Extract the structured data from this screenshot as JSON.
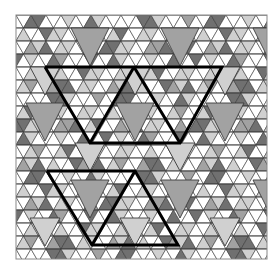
{
  "figure": {
    "type": "geometric-tiling",
    "frame": {
      "x": 16,
      "y": 15,
      "width": 251,
      "height": 244
    },
    "colors": {
      "background": "#ffffff",
      "white": "#ffffff",
      "light": "#d0d0d0",
      "mid": "#a2a2a2",
      "dark": "#707070",
      "stroke": "#3a3a3a",
      "bold": "#000000"
    },
    "lattice": {
      "side": 15,
      "row_height": 13
    },
    "large_triangles": [
      {
        "cx": 90,
        "top": 28,
        "w": 38,
        "h": 38,
        "fill": "mid"
      },
      {
        "cx": 180,
        "top": 28,
        "w": 38,
        "h": 38,
        "fill": "mid"
      },
      {
        "cx": 272,
        "top": 28,
        "w": 38,
        "h": 38,
        "fill": "mid"
      },
      {
        "cx": 45,
        "top": 103,
        "w": 38,
        "h": 38,
        "fill": "mid"
      },
      {
        "cx": 135,
        "top": 103,
        "w": 38,
        "h": 38,
        "fill": "mid"
      },
      {
        "cx": 225,
        "top": 103,
        "w": 38,
        "h": 38,
        "fill": "mid"
      },
      {
        "cx": 90,
        "top": 180,
        "w": 38,
        "h": 38,
        "fill": "mid"
      },
      {
        "cx": 180,
        "top": 180,
        "w": 38,
        "h": 38,
        "fill": "mid"
      },
      {
        "cx": 272,
        "top": 180,
        "w": 38,
        "h": 38,
        "fill": "mid"
      },
      {
        "cx": 45,
        "top": 67,
        "w": 30,
        "h": 28,
        "fill": "light"
      },
      {
        "cx": 135,
        "top": 67,
        "w": 30,
        "h": 28,
        "fill": "light"
      },
      {
        "cx": 225,
        "top": 67,
        "w": 30,
        "h": 28,
        "fill": "light"
      },
      {
        "cx": 90,
        "top": 143,
        "w": 30,
        "h": 28,
        "fill": "light"
      },
      {
        "cx": 180,
        "top": 143,
        "w": 30,
        "h": 28,
        "fill": "light"
      },
      {
        "cx": 45,
        "top": 218,
        "w": 30,
        "h": 28,
        "fill": "light"
      },
      {
        "cx": 135,
        "top": 218,
        "w": 30,
        "h": 28,
        "fill": "light"
      },
      {
        "cx": 225,
        "top": 218,
        "w": 30,
        "h": 28,
        "fill": "light"
      }
    ],
    "bold_outlines": [
      {
        "name": "upper-figure",
        "polyline": [
          [
            45,
            67
          ],
          [
            222,
            67
          ],
          [
            180,
            143
          ],
          [
            90,
            143
          ],
          [
            45,
            67
          ]
        ],
        "inner": [
          [
            [
              90,
              143
            ],
            [
              134,
              67
            ]
          ],
          [
            [
              134,
              67
            ],
            [
              180,
              143
            ]
          ]
        ]
      },
      {
        "name": "lower-figure",
        "polyline": [
          [
            47,
            171
          ],
          [
            135,
            171
          ],
          [
            178,
            245
          ],
          [
            92,
            245
          ],
          [
            47,
            171
          ]
        ],
        "inner": [
          [
            [
              92,
              245
            ],
            [
              135,
              171
            ]
          ]
        ]
      }
    ]
  }
}
